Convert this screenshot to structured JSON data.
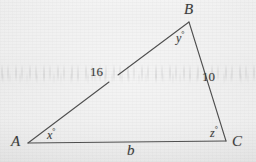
{
  "figure": {
    "background_color": "#ebebeb",
    "stroke_color": "#4a4a4a",
    "text_color": "#3c3c3c",
    "vertices": [
      {
        "name": "A",
        "label": "A",
        "x": 28,
        "y": 143,
        "label_x": 11,
        "label_y": 134
      },
      {
        "name": "B",
        "label": "B",
        "x": 189,
        "y": 22,
        "label_x": 184,
        "label_y": 2
      },
      {
        "name": "C",
        "label": "C",
        "x": 226,
        "y": 141,
        "label_x": 232,
        "label_y": 134
      }
    ],
    "sides": [
      {
        "name": "side-ab",
        "label": "16",
        "from": "A",
        "to": "B",
        "label_x": 90,
        "label_y": 65
      },
      {
        "name": "side-bc",
        "label": "10",
        "from": "B",
        "to": "C",
        "label_x": 202,
        "label_y": 70
      },
      {
        "name": "side-ac",
        "label": "b",
        "from": "A",
        "to": "C",
        "label_x": 127,
        "label_y": 143
      }
    ],
    "angles": [
      {
        "name": "angle-a",
        "label": "x",
        "degree_symbol": "°",
        "label_x": 47,
        "label_y": 128
      },
      {
        "name": "angle-b",
        "label": "y",
        "degree_symbol": "°",
        "label_x": 176,
        "label_y": 31
      },
      {
        "name": "angle-c",
        "label": "z",
        "degree_symbol": "°",
        "label_x": 210,
        "label_y": 126
      }
    ]
  }
}
